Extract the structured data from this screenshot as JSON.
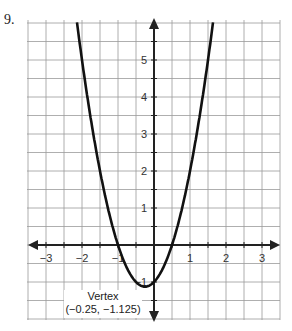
{
  "problem_number": "9.",
  "chart_data": {
    "type": "line",
    "title": "",
    "xlabel": "",
    "ylabel": "",
    "xlim": [
      -3.5,
      3.5
    ],
    "ylim": [
      -2,
      6
    ],
    "grid": true,
    "grid_step": 0.5,
    "x_ticks": [
      "-3",
      "-2",
      "-1",
      "1",
      "2",
      "3"
    ],
    "y_ticks": [
      "-1",
      "1",
      "2",
      "3",
      "4",
      "5"
    ],
    "series": [
      {
        "name": "y = 2(x + 0.25)^2 - 1.125",
        "x": [
          -2.0,
          -1.5,
          -1.0,
          -0.5,
          -0.25,
          0,
          0.5,
          1.0,
          1.5
        ],
        "values": [
          5.0,
          3.0,
          0.0,
          -1.0,
          -1.125,
          -1.0,
          0.0,
          2.0,
          5.0
        ]
      }
    ],
    "annotations": [
      {
        "text": "Vertex",
        "x": -0.25,
        "y": -1.125
      },
      {
        "text": "(−0.25, −1.125)",
        "x": -0.25,
        "y": -1.125
      }
    ]
  },
  "labels": {
    "x": [
      "−3",
      "−2",
      "−1",
      "1",
      "2",
      "3"
    ],
    "y": [
      "5",
      "4",
      "3",
      "2",
      "1",
      "−1"
    ],
    "vertex_title": "Vertex",
    "vertex_coords": "(−0.25, −1.125)"
  }
}
